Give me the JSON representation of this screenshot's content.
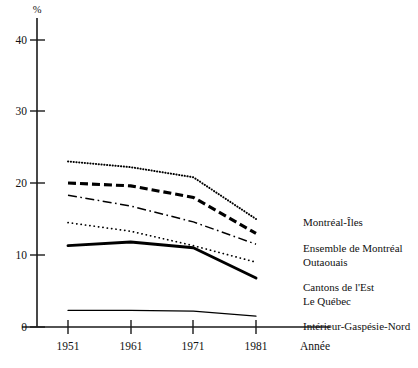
{
  "chart_data": {
    "type": "line",
    "title": "",
    "subtitle": "",
    "xlabel": "Année",
    "ylabel": "%",
    "x": [
      1951,
      1961,
      1971,
      1981
    ],
    "xticklabels": [
      "1951",
      "1961",
      "1971",
      "1981"
    ],
    "yticklabels": [
      "0",
      "10",
      "20",
      "30",
      "40"
    ],
    "yticks": [
      0,
      10,
      20,
      30,
      40
    ],
    "ylim": [
      0,
      44
    ],
    "xlim": [
      1947,
      1990
    ],
    "grid": false,
    "legend_position": "right",
    "series": [
      {
        "name": "Montréal-Îles",
        "style": "fine-dotted",
        "values": [
          23.0,
          22.2,
          20.8,
          15.0
        ]
      },
      {
        "name": "Ensemble de Montréal",
        "style": "thick-dashed",
        "values": [
          20.0,
          19.6,
          18.0,
          13.0
        ]
      },
      {
        "name": "Outaouais",
        "style": "dash-dot",
        "values": [
          18.3,
          16.8,
          14.6,
          11.5
        ]
      },
      {
        "name": "Cantons de l'Est",
        "style": "sparse-dotted",
        "values": [
          14.5,
          13.3,
          11.3,
          9.0
        ]
      },
      {
        "name": "Le Québec",
        "style": "thick-solid",
        "values": [
          11.3,
          11.8,
          11.0,
          6.8
        ]
      },
      {
        "name": "Intérieur-Gaspésie-Nord",
        "style": "thin-solid",
        "values": [
          2.3,
          2.3,
          2.2,
          1.5
        ]
      }
    ]
  },
  "legend": {
    "entries": [
      {
        "label": "Montréal-Îles"
      },
      {
        "label": "Ensemble de Montréal"
      },
      {
        "label": "Outaouais"
      },
      {
        "label": "Cantons de l'Est"
      },
      {
        "label": "Le Québec"
      },
      {
        "label": "Intérieur-Gaspésie-Nord"
      }
    ]
  }
}
